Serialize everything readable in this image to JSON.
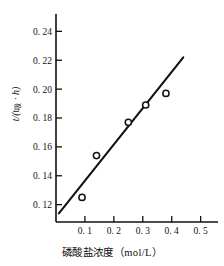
{
  "chart_data": {
    "type": "scatter",
    "title": "",
    "xlabel": "磷酸盐浓度（mol/L）",
    "ylabel": "t/(t吸·h)",
    "ylabel_parts": {
      "numerator": "t",
      "slash": "/(",
      "denom_var": "t",
      "denom_sub": "吸",
      "dot": "·",
      "denom_h": "h",
      "close": ")"
    },
    "x": [
      0.09,
      0.14,
      0.25,
      0.31,
      0.38
    ],
    "values": [
      0.125,
      0.154,
      0.177,
      0.189,
      0.197
    ],
    "points": [
      {
        "x": 0.09,
        "y": 0.125
      },
      {
        "x": 0.14,
        "y": 0.154
      },
      {
        "x": 0.25,
        "y": 0.177
      },
      {
        "x": 0.31,
        "y": 0.189
      },
      {
        "x": 0.38,
        "y": 0.197
      }
    ],
    "fit_line": {
      "x0": 0.01,
      "y0": 0.114,
      "x1": 0.44,
      "y1": 0.222
    },
    "xlim": [
      0.0,
      0.56
    ],
    "ylim": [
      0.108,
      0.252
    ],
    "xticks": [
      0.1,
      0.2,
      0.3,
      0.4,
      0.5
    ],
    "xtick_labels": [
      "0. 1",
      "0. 2",
      "0. 3",
      "0. 4",
      "0. 5"
    ],
    "yticks": [
      0.12,
      0.14,
      0.16,
      0.18,
      0.2,
      0.22,
      0.24
    ],
    "ytick_labels": [
      "0. 12",
      "0. 14",
      "0. 16",
      "0. 18",
      "0. 20",
      "0. 22",
      "0. 24"
    ],
    "grid": false,
    "legend": null,
    "marker_style": "open-circle",
    "line_color": "#111111"
  }
}
